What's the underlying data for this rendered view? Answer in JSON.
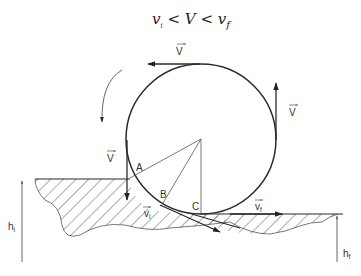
{
  "title": {
    "v": "v",
    "i": "i",
    "lt1": " < V < ",
    "v2": "v",
    "f": "f"
  },
  "labels": {
    "vec_top": "V",
    "vec_right": "V",
    "vec_left": "V",
    "point_a": "A",
    "point_b": "B",
    "point_c": "C",
    "vi": "v",
    "vi_sub": "i",
    "vf": "v",
    "vf_sub": "f",
    "hi": "h",
    "hi_sub": "i",
    "hf": "h",
    "hf_sub": "f"
  },
  "colors": {
    "stroke": "#2a2a2a",
    "thin": "#555555",
    "hatch": "#444444"
  }
}
